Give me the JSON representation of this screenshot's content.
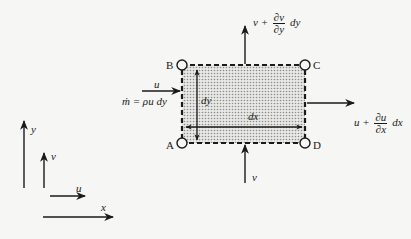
{
  "diagram": {
    "corners": {
      "a": "A",
      "b": "B",
      "c": "C",
      "d": "D"
    },
    "dimensions": {
      "width": "dx",
      "height": "dy"
    },
    "inflow_left": {
      "label": "u",
      "mass_flux": "ṁ = ρu dy"
    },
    "outflow_right": {
      "prefix": "u +",
      "num": "∂u",
      "den": "∂x",
      "suffix": "dx"
    },
    "inflow_bottom": {
      "label": "v"
    },
    "outflow_top": {
      "prefix": "v +",
      "num": "∂v",
      "den": "∂y",
      "suffix": "dy"
    },
    "axes": {
      "x": "x",
      "y": "y",
      "u": "u",
      "v": "v"
    },
    "colors": {
      "ink": "#1a1a1a",
      "background": "#f6f6f4",
      "fill_dots": "#9a9a9a"
    }
  }
}
